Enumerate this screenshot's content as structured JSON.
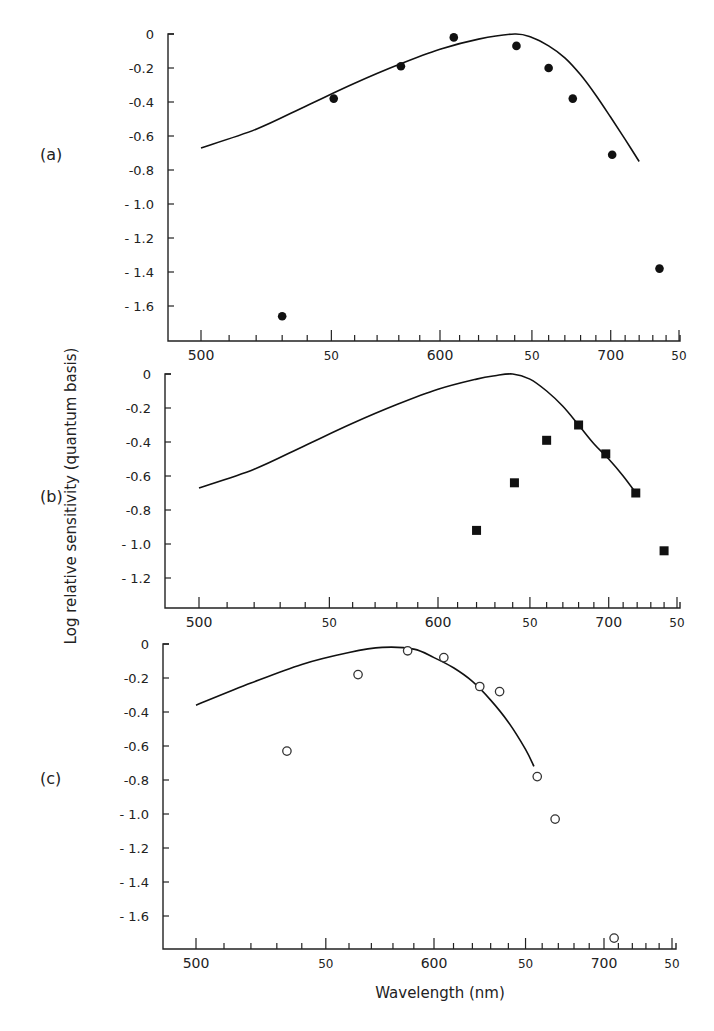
{
  "figure": {
    "ylabel": "Log relative sensitivity (quantum basis)",
    "xlabel": "Wavelength (nm)"
  },
  "chart_data": [
    {
      "type": "scatter",
      "panel": "(a)",
      "title": "",
      "xlabel": "Wavelength (nm)",
      "ylabel": "Log relative sensitivity (quantum basis)",
      "x_scale": "reciprocal (wavenumber-linear)",
      "xlim": [
        480,
        750
      ],
      "ylim": [
        -1.8,
        0
      ],
      "x_ticks": [
        {
          "value": 500,
          "label": "500"
        },
        {
          "value": 550,
          "label": "50"
        },
        {
          "value": 600,
          "label": "600"
        },
        {
          "value": 650,
          "label": "50"
        },
        {
          "value": 700,
          "label": "700"
        },
        {
          "value": 750,
          "label": "50"
        }
      ],
      "y_ticks": [
        {
          "value": 0,
          "label": "0"
        },
        {
          "value": -0.2,
          "label": "-0.2"
        },
        {
          "value": -0.4,
          "label": "-0.4"
        },
        {
          "value": -0.6,
          "label": "-0.6"
        },
        {
          "value": -0.8,
          "label": "-0.8"
        },
        {
          "value": -1.0,
          "label": "- 1.0"
        },
        {
          "value": -1.2,
          "label": "- 1.2"
        },
        {
          "value": -1.4,
          "label": "- 1.4"
        },
        {
          "value": -1.6,
          "label": "- 1.6"
        }
      ],
      "marker": "filled-circle",
      "series": [
        {
          "name": "measured",
          "x": [
            530,
            551,
            581,
            607,
            641,
            660,
            675,
            701,
            735
          ],
          "y": [
            -1.66,
            -0.38,
            -0.19,
            -0.02,
            -0.07,
            -0.2,
            -0.38,
            -0.71,
            -1.38
          ]
        },
        {
          "name": "fitted curve",
          "style": "line",
          "x": [
            500,
            520,
            540,
            560,
            580,
            600,
            620,
            640,
            650,
            660,
            670,
            680,
            690,
            700,
            710,
            720
          ],
          "y": [
            -0.67,
            -0.56,
            -0.42,
            -0.29,
            -0.18,
            -0.09,
            -0.03,
            0.0,
            -0.02,
            -0.07,
            -0.14,
            -0.24,
            -0.36,
            -0.49,
            -0.62,
            -0.75
          ]
        }
      ],
      "grid": false,
      "legend": null
    },
    {
      "type": "scatter",
      "panel": "(b)",
      "title": "",
      "xlabel": "Wavelength (nm)",
      "ylabel": "Log relative sensitivity (quantum basis)",
      "x_scale": "reciprocal (wavenumber-linear)",
      "xlim": [
        480,
        750
      ],
      "ylim": [
        -1.4,
        0
      ],
      "x_ticks": [
        {
          "value": 500,
          "label": "500"
        },
        {
          "value": 550,
          "label": "50"
        },
        {
          "value": 600,
          "label": "600"
        },
        {
          "value": 650,
          "label": "50"
        },
        {
          "value": 700,
          "label": "700"
        },
        {
          "value": 750,
          "label": "50"
        }
      ],
      "y_ticks": [
        {
          "value": 0,
          "label": "0"
        },
        {
          "value": -0.2,
          "label": "-0.2"
        },
        {
          "value": -0.4,
          "label": "-0.4"
        },
        {
          "value": -0.6,
          "label": "-0.6"
        },
        {
          "value": -0.8,
          "label": "-0.8"
        },
        {
          "value": -1.0,
          "label": "- 1.0"
        },
        {
          "value": -1.2,
          "label": "- 1.2"
        }
      ],
      "marker": "filled-square",
      "series": [
        {
          "name": "measured",
          "x": [
            620,
            641,
            660,
            680,
            698,
            719,
            740
          ],
          "y": [
            -0.92,
            -0.64,
            -0.39,
            -0.3,
            -0.47,
            -0.7,
            -1.04
          ]
        },
        {
          "name": "fitted curve",
          "style": "line",
          "x": [
            500,
            520,
            540,
            560,
            580,
            600,
            620,
            630,
            640,
            650,
            660,
            670,
            680,
            690,
            700,
            710,
            720
          ],
          "y": [
            -0.67,
            -0.56,
            -0.42,
            -0.29,
            -0.18,
            -0.09,
            -0.03,
            -0.01,
            0.0,
            -0.03,
            -0.1,
            -0.19,
            -0.3,
            -0.41,
            -0.5,
            -0.6,
            -0.71
          ]
        }
      ],
      "grid": false,
      "legend": null
    },
    {
      "type": "scatter",
      "panel": "(c)",
      "title": "",
      "xlabel": "Wavelength (nm)",
      "ylabel": "Log relative sensitivity (quantum basis)",
      "x_scale": "reciprocal (wavenumber-linear)",
      "xlim": [
        480,
        750
      ],
      "ylim": [
        -1.8,
        0
      ],
      "x_ticks": [
        {
          "value": 500,
          "label": "500"
        },
        {
          "value": 550,
          "label": "50"
        },
        {
          "value": 600,
          "label": "600"
        },
        {
          "value": 650,
          "label": "50"
        },
        {
          "value": 700,
          "label": "700"
        },
        {
          "value": 750,
          "label": "50"
        }
      ],
      "y_ticks": [
        {
          "value": 0,
          "label": "0"
        },
        {
          "value": -0.2,
          "label": "-0.2"
        },
        {
          "value": -0.4,
          "label": "-0.4"
        },
        {
          "value": -0.6,
          "label": "-0.6"
        },
        {
          "value": -0.8,
          "label": "-0.8"
        },
        {
          "value": -1.0,
          "label": "- 1.0"
        },
        {
          "value": -1.2,
          "label": "- 1.2"
        },
        {
          "value": -1.4,
          "label": "- 1.4"
        },
        {
          "value": -1.6,
          "label": "- 1.6"
        }
      ],
      "marker": "open-circle",
      "series": [
        {
          "name": "measured",
          "x": [
            534,
            564,
            587,
            605,
            624,
            635,
            657,
            668,
            707
          ],
          "y": [
            -0.63,
            -0.18,
            -0.04,
            -0.08,
            -0.25,
            -0.28,
            -0.78,
            -1.03,
            -1.73
          ]
        },
        {
          "name": "fitted curve",
          "style": "line",
          "x": [
            500,
            520,
            540,
            560,
            575,
            590,
            600,
            610,
            620,
            630,
            640,
            650,
            655
          ],
          "y": [
            -0.36,
            -0.23,
            -0.12,
            -0.05,
            -0.02,
            -0.03,
            -0.08,
            -0.14,
            -0.22,
            -0.33,
            -0.46,
            -0.62,
            -0.72
          ]
        }
      ],
      "grid": false,
      "legend": null
    }
  ]
}
